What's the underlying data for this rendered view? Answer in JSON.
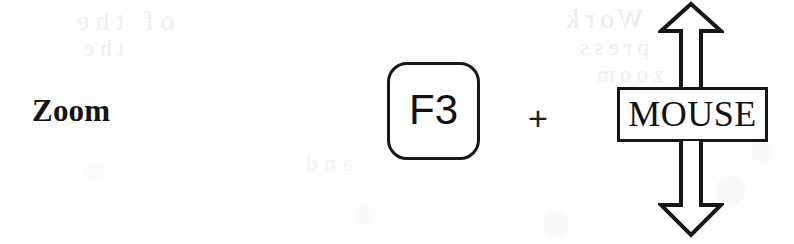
{
  "figure": {
    "type": "keyboard-shortcut-diagram",
    "caption_text": "Zoom",
    "background_color": "#fefefe",
    "ink_color": "#161618"
  },
  "action": {
    "label": "Zoom"
  },
  "shortcut": {
    "key": {
      "label": "F3",
      "shape": "rounded-rect-keycap"
    },
    "combiner": {
      "label": "+",
      "icon": "plus-icon"
    },
    "device": {
      "label": "MOUSE",
      "shape": "rectangle",
      "motion": "vertical",
      "arrows": [
        {
          "direction": "up",
          "icon": "arrow-up-outline-icon"
        },
        {
          "direction": "down",
          "icon": "arrow-down-outline-icon"
        }
      ]
    }
  },
  "bleed_through": {
    "note": "faint mirrored show-through text from the reverse side of the scanned page",
    "lines": [
      "of the",
      "the",
      "Work",
      "press",
      "to zoom",
      "and"
    ]
  }
}
